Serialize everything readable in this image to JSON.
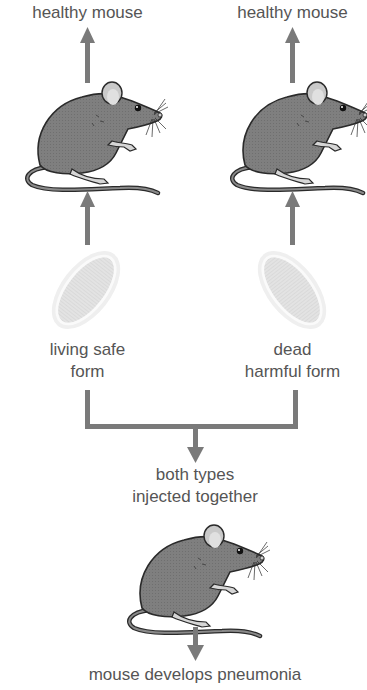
{
  "diagram": {
    "title": "",
    "colors": {
      "arrow": "#7a7a7a",
      "mouse_body": "#7d7d7d",
      "mouse_outline": "#2a2a2a",
      "mouse_light": "#d6d6d6",
      "bacterium_fill": "#e2e2e2",
      "bacterium_halo": "#eeeeee",
      "text": "#555555"
    },
    "top_left": {
      "result_label": "healthy mouse",
      "inoculum_label_line1": "living safe",
      "inoculum_label_line2": "form",
      "inoculum_icon": "bacterium-icon",
      "subject_icon": "mouse-icon"
    },
    "top_right": {
      "result_label": "healthy mouse",
      "inoculum_label_line1": "dead",
      "inoculum_label_line2": "harmful form",
      "inoculum_icon": "bacterium-icon",
      "subject_icon": "mouse-icon"
    },
    "combined": {
      "label_line1": "both types",
      "label_line2": "injected together",
      "subject_icon": "mouse-icon",
      "result_label": "mouse develops pneumonia"
    }
  }
}
